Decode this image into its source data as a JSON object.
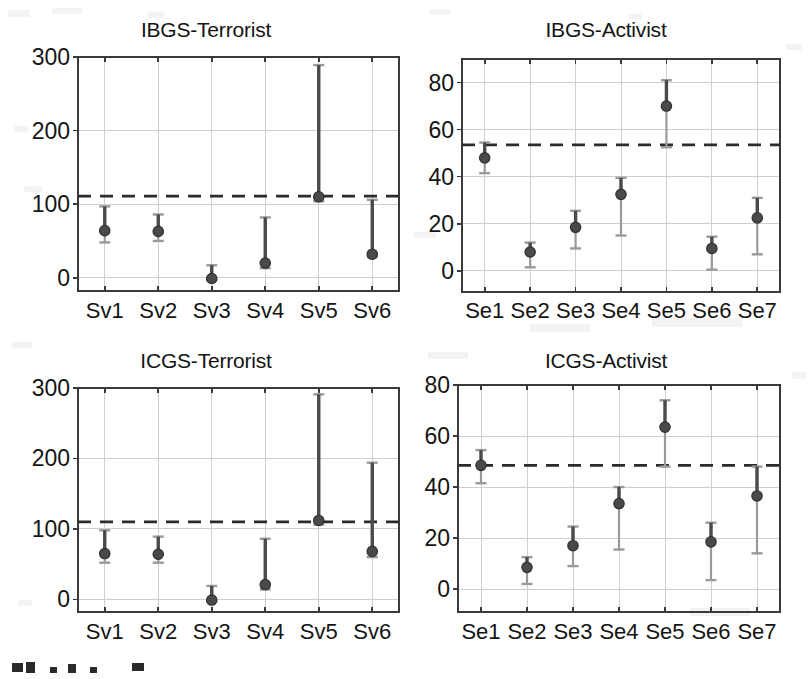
{
  "figure": {
    "background_color": "#ffffff",
    "marker_color": "#4a4a4a",
    "whisker_color": "#9a9a9a",
    "reference_line_color": "#2b2b2b",
    "grid_color": "#cfcfcf",
    "axis_color": "#3a3a3a"
  },
  "panels": [
    {
      "id": "ibgs-terrorist",
      "title": "IBGS-Terrorist",
      "chart_data": {
        "type": "scatter",
        "title": "IBGS-Terrorist",
        "xlabel": "",
        "ylabel": "",
        "categories": [
          "Sv1",
          "Sv2",
          "Sv3",
          "Sv4",
          "Sv5",
          "Sv6"
        ],
        "ylim": [
          -18,
          300
        ],
        "yticks": [
          0,
          100,
          200,
          300
        ],
        "grid": true,
        "legend": "none",
        "reference_line": 111,
        "series": [
          {
            "name": "estimate",
            "values": [
              64,
              63,
              -1,
              20,
              110,
              32
            ]
          },
          {
            "name": "lower_bound",
            "values": [
              48,
              50,
              -3,
              13,
              104,
              28
            ]
          },
          {
            "name": "upper_bound",
            "values": [
              97,
              86,
              17,
              82,
              289,
              106
            ]
          }
        ]
      }
    },
    {
      "id": "ibgs-activist",
      "title": "IBGS-Activist",
      "chart_data": {
        "type": "scatter",
        "title": "IBGS-Activist",
        "xlabel": "",
        "ylabel": "",
        "categories": [
          "Se1",
          "Se2",
          "Se3",
          "Se4",
          "Se5",
          "Se6",
          "Se7"
        ],
        "ylim": [
          -9,
          90
        ],
        "yticks": [
          0,
          20,
          40,
          60,
          80
        ],
        "grid": true,
        "legend": "none",
        "reference_line": 53.5,
        "series": [
          {
            "name": "estimate",
            "values": [
              48,
              8,
              18.5,
              32.5,
              70,
              9.5,
              22.5
            ]
          },
          {
            "name": "lower_bound",
            "values": [
              41.5,
              1.5,
              9.5,
              15,
              52.5,
              0.5,
              7
            ]
          },
          {
            "name": "upper_bound",
            "values": [
              54.5,
              12,
              25.5,
              39.5,
              81,
              14.5,
              31
            ]
          }
        ]
      }
    },
    {
      "id": "icgs-terrorist",
      "title": "ICGS-Terrorist",
      "chart_data": {
        "type": "scatter",
        "title": "ICGS-Terrorist",
        "xlabel": "",
        "ylabel": "",
        "categories": [
          "Sv1",
          "Sv2",
          "Sv3",
          "Sv4",
          "Sv5",
          "Sv6"
        ],
        "ylim": [
          -18,
          300
        ],
        "yticks": [
          0,
          100,
          200,
          300
        ],
        "grid": true,
        "legend": "none",
        "reference_line": 110,
        "series": [
          {
            "name": "estimate",
            "values": [
              65,
              64,
              -1,
              21,
              112,
              68
            ]
          },
          {
            "name": "lower_bound",
            "values": [
              52,
              52,
              -3,
              14,
              106,
              60
            ]
          },
          {
            "name": "upper_bound",
            "values": [
              98,
              89,
              19,
              86,
              291,
              194
            ]
          }
        ]
      }
    },
    {
      "id": "icgs-activist",
      "title": "ICGS-Activist",
      "chart_data": {
        "type": "scatter",
        "title": "ICGS-Activist",
        "xlabel": "",
        "ylabel": "",
        "categories": [
          "Se1",
          "Se2",
          "Se3",
          "Se4",
          "Se5",
          "Se6",
          "Se7"
        ],
        "ylim": [
          -9,
          80
        ],
        "yticks": [
          0,
          20,
          40,
          60,
          80
        ],
        "grid": true,
        "legend": "none",
        "reference_line": 48.5,
        "series": [
          {
            "name": "estimate",
            "values": [
              48.5,
              8.5,
              17,
              33.5,
              63.5,
              18.5,
              36.5
            ]
          },
          {
            "name": "lower_bound",
            "values": [
              41.5,
              2,
              9,
              15.5,
              48,
              3.5,
              14
            ]
          },
          {
            "name": "upper_bound",
            "values": [
              54.5,
              12.5,
              24.5,
              40,
              74,
              26,
              48
            ]
          }
        ]
      }
    }
  ]
}
